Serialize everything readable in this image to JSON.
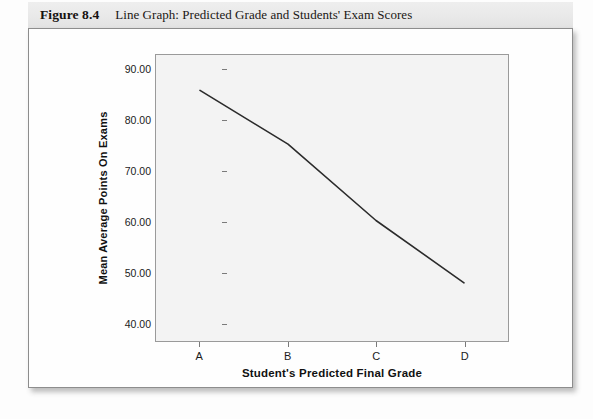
{
  "figure": {
    "number": "Figure 8.4",
    "title": "Line Graph: Predicted Grade and Students' Exam Scores"
  },
  "chart_data": {
    "type": "line",
    "title": "",
    "categories": [
      "A",
      "B",
      "C",
      "D"
    ],
    "values": [
      86.0,
      75.4,
      60.3,
      48.0
    ],
    "series": [
      {
        "name": "Mean Average Points On Exams",
        "values": [
          86.0,
          75.4,
          60.3,
          48.0
        ]
      }
    ],
    "xlabel": "Student's Predicted Final Grade",
    "ylabel": "Mean Average Points On Exams",
    "ylim": [
      36.5,
      93.0
    ],
    "yticks": [
      40,
      50,
      60,
      70,
      80,
      90
    ],
    "ytick_labels": [
      "40.00",
      "50.00",
      "60.00",
      "70.00",
      "80.00",
      "90.00"
    ],
    "xtick_labels": [
      "A",
      "B",
      "C",
      "D"
    ],
    "grid": false,
    "legend": "none",
    "line_color": "#2b2b2b",
    "plot_background": "#f3f3f3"
  },
  "colors": {
    "header_band": "#e9e9e9",
    "card_background": "#fefefe",
    "border": "#8d8d8d",
    "text": "#111111"
  }
}
